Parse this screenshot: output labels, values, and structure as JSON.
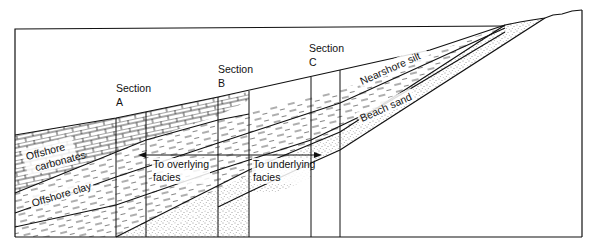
{
  "figure": {
    "type": "facies-cross-section",
    "sections": [
      {
        "id": "A",
        "label_line1": "Section",
        "label_line2": "A"
      },
      {
        "id": "B",
        "label_line1": "Section",
        "label_line2": "B"
      },
      {
        "id": "C",
        "label_line1": "Section",
        "label_line2": "C"
      }
    ],
    "facies": [
      {
        "name": "offshore-carbonates",
        "label_line1": "Offshore",
        "label_line2": "carbonates",
        "pattern": "brick"
      },
      {
        "name": "offshore-clay",
        "label": "Offshore clay",
        "pattern": "dash"
      },
      {
        "name": "nearshore-silt",
        "label": "Nearshore silt",
        "pattern": "dash"
      },
      {
        "name": "beach-sand",
        "label": "Beach sand",
        "pattern": "stipple"
      }
    ],
    "arrows": [
      {
        "name": "to-overlying",
        "label_line1": "To overlying",
        "label_line2": "facies",
        "direction": "left"
      },
      {
        "name": "to-underlying",
        "label_line1": "To underlying",
        "label_line2": "facies",
        "direction": "right"
      }
    ]
  }
}
